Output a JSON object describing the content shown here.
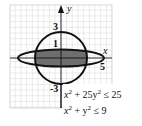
{
  "diagram": {
    "type": "region-plot",
    "axes": {
      "x_label": "x",
      "y_label": "y"
    },
    "tick_labels": {
      "y_top": "3",
      "y_small": "1",
      "x_right": "5",
      "y_bottom": "-3"
    },
    "inequalities": [
      {
        "text_lhs": "x",
        "sup1": "2",
        "mid": " + 25y",
        "sup2": "2",
        "rhs": " ≤ 25"
      },
      {
        "text_lhs": "x",
        "sup1": "2",
        "mid": " + y",
        "sup2": "2",
        "rhs": " ≤ 9"
      }
    ],
    "colors": {
      "shade": "#6e6e6e",
      "curve": "#111111",
      "grid": "#bdbdbd"
    }
  }
}
